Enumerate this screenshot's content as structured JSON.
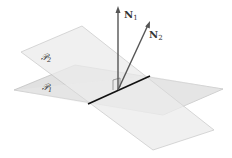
{
  "figure": {
    "planes": [
      {
        "name": "plane-1",
        "label": "𝒫",
        "subscript": "1",
        "fill": "#d9d9d9"
      },
      {
        "name": "plane-2",
        "label": "𝒫",
        "subscript": "2",
        "fill": "#e6e6e6"
      }
    ],
    "vectors": [
      {
        "name": "N",
        "subscript": "1"
      },
      {
        "name": "N",
        "subscript": "2"
      }
    ],
    "colors": {
      "plane_edge": "#b5b5b5",
      "intersection_line": "#111111",
      "vector": "#555555"
    }
  }
}
